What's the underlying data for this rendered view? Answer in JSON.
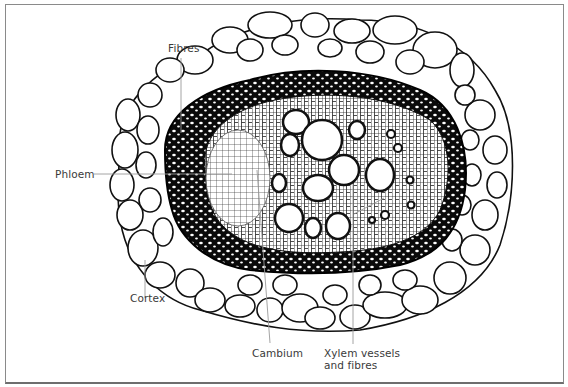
{
  "figure": {
    "labels": {
      "fibres": "Fibres",
      "phloem": "Phloem",
      "cortex": "Cortex",
      "cambium": "Cambium",
      "xylem_line1": "Xylem vessels",
      "xylem_line2": "and fibres"
    },
    "colors": {
      "ink": "#111111",
      "label_text": "#3a3a3a",
      "leader_line": "#9a9a9a",
      "frame": "#8a8a8a",
      "background": "#ffffff"
    }
  }
}
